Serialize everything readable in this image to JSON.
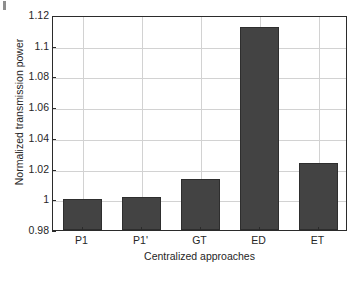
{
  "chart_data": {
    "type": "bar",
    "title": "",
    "xlabel": "Centralized approaches",
    "ylabel": "Normalized transmission power",
    "categories": [
      "P1",
      "P1'",
      "GT",
      "ED",
      "ET"
    ],
    "values": [
      1.0,
      1.0012,
      1.0132,
      1.1125,
      1.0238
    ],
    "ylim": [
      0.98,
      1.12
    ],
    "ytick_labels": [
      "0.98",
      "1",
      "1.02",
      "1.04",
      "1.06",
      "1.08",
      "1.1",
      "1.12"
    ],
    "ytick_values": [
      0.98,
      1.0,
      1.02,
      1.04,
      1.06,
      1.08,
      1.1,
      1.12
    ],
    "grid": true,
    "legend": "none",
    "bar_color": "#434343",
    "bar_edge_color": "#2e2e2e",
    "grid_color": "#d2d2d2",
    "axis_color": "#2b2b2b",
    "background": "#ffffff"
  }
}
